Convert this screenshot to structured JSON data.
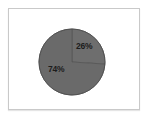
{
  "figure": {
    "background_color": "#ffffff",
    "frame_color": "#c9c9c9"
  },
  "chart_data": {
    "type": "pie",
    "title": "",
    "subtitle": "",
    "xlabel": "",
    "ylabel": "",
    "grid": false,
    "legend_position": "none",
    "start_angle_deg": 0,
    "direction": "clockwise",
    "center": {
      "x": 71,
      "y": 61
    },
    "radius": 33,
    "categories": [
      "Slice 1",
      "Slice 2"
    ],
    "values": [
      26,
      74
    ],
    "labels": [
      "26%",
      "74%"
    ],
    "unit": "%",
    "total": 100,
    "slices": [
      {
        "label": "26%",
        "value": 26,
        "start_angle_deg": 0,
        "end_angle_deg": 93.6,
        "color": "#6e6e6e",
        "edge_color": "#555555",
        "label_x": 75,
        "label_y": 41
      },
      {
        "label": "74%",
        "value": 74,
        "start_angle_deg": 93.6,
        "end_angle_deg": 360,
        "color": "#6a6a6a",
        "edge_color": "#555555",
        "label_x": 47,
        "label_y": 64
      }
    ]
  }
}
